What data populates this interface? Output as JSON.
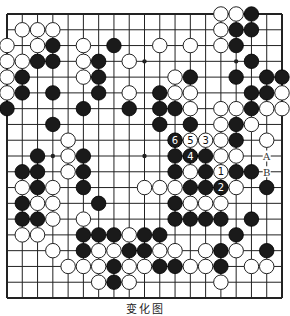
{
  "diagram": {
    "type": "go-board",
    "size": 19,
    "line_color": "#222222",
    "black_color": "#1a1a1a",
    "white_color": "#ffffff",
    "grid": {
      "left": 7,
      "top": 14,
      "right": 282,
      "bottom": 298
    },
    "star_points": [
      [
        3,
        3
      ],
      [
        3,
        9
      ],
      [
        3,
        15
      ],
      [
        9,
        3
      ],
      [
        9,
        9
      ],
      [
        9,
        15
      ],
      [
        15,
        3
      ],
      [
        15,
        9
      ],
      [
        15,
        15
      ]
    ],
    "stones": {
      "black": [
        [
          16,
          0
        ],
        [
          15,
          1
        ],
        [
          16,
          1
        ],
        [
          3,
          2
        ],
        [
          7,
          2
        ],
        [
          15,
          2
        ],
        [
          2,
          3
        ],
        [
          3,
          3
        ],
        [
          6,
          3
        ],
        [
          16,
          3
        ],
        [
          1,
          4
        ],
        [
          6,
          4
        ],
        [
          12,
          4
        ],
        [
          15,
          4
        ],
        [
          17,
          4
        ],
        [
          18,
          4
        ],
        [
          1,
          5
        ],
        [
          3,
          5
        ],
        [
          6,
          5
        ],
        [
          10,
          5
        ],
        [
          16,
          5
        ],
        [
          17,
          5
        ],
        [
          0,
          6
        ],
        [
          5,
          6
        ],
        [
          8,
          6
        ],
        [
          10,
          6
        ],
        [
          11,
          6
        ],
        [
          16,
          6
        ],
        [
          3,
          7
        ],
        [
          10,
          7
        ],
        [
          12,
          7
        ],
        [
          15,
          7
        ],
        [
          15,
          8
        ],
        [
          2,
          9
        ],
        [
          5,
          9
        ],
        [
          11,
          9
        ],
        [
          13,
          9
        ],
        [
          1,
          10
        ],
        [
          2,
          10
        ],
        [
          5,
          10
        ],
        [
          11,
          10
        ],
        [
          13,
          10
        ],
        [
          15,
          10
        ],
        [
          16,
          10
        ],
        [
          2,
          11
        ],
        [
          5,
          11
        ],
        [
          12,
          11
        ],
        [
          13,
          11
        ],
        [
          17,
          11
        ],
        [
          1,
          12
        ],
        [
          6,
          12
        ],
        [
          11,
          12
        ],
        [
          1,
          13
        ],
        [
          2,
          13
        ],
        [
          11,
          13
        ],
        [
          12,
          13
        ],
        [
          13,
          13
        ],
        [
          14,
          13
        ],
        [
          16,
          13
        ],
        [
          5,
          14
        ],
        [
          6,
          14
        ],
        [
          7,
          14
        ],
        [
          9,
          14
        ],
        [
          10,
          14
        ],
        [
          15,
          14
        ],
        [
          5,
          15
        ],
        [
          8,
          15
        ],
        [
          9,
          15
        ],
        [
          14,
          15
        ],
        [
          17,
          15
        ],
        [
          7,
          16
        ],
        [
          10,
          16
        ],
        [
          11,
          16
        ],
        [
          14,
          16
        ],
        [
          7,
          17
        ]
      ],
      "white": [
        [
          14,
          0
        ],
        [
          15,
          0
        ],
        [
          1,
          1
        ],
        [
          2,
          1
        ],
        [
          3,
          1
        ],
        [
          14,
          1
        ],
        [
          0,
          2
        ],
        [
          2,
          2
        ],
        [
          5,
          2
        ],
        [
          10,
          2
        ],
        [
          12,
          2
        ],
        [
          14,
          2
        ],
        [
          0,
          3
        ],
        [
          1,
          3
        ],
        [
          5,
          3
        ],
        [
          8,
          3
        ],
        [
          0,
          4
        ],
        [
          5,
          4
        ],
        [
          11,
          4
        ],
        [
          0,
          5
        ],
        [
          8,
          5
        ],
        [
          11,
          5
        ],
        [
          12,
          5
        ],
        [
          18,
          5
        ],
        [
          12,
          6
        ],
        [
          14,
          6
        ],
        [
          15,
          6
        ],
        [
          17,
          6
        ],
        [
          18,
          6
        ],
        [
          14,
          7
        ],
        [
          16,
          7
        ],
        [
          4,
          8
        ],
        [
          14,
          8
        ],
        [
          17,
          8
        ],
        [
          4,
          9
        ],
        [
          14,
          9
        ],
        [
          15,
          9
        ],
        [
          4,
          10
        ],
        [
          12,
          10
        ],
        [
          1,
          11
        ],
        [
          3,
          11
        ],
        [
          9,
          11
        ],
        [
          10,
          11
        ],
        [
          11,
          11
        ],
        [
          15,
          11
        ],
        [
          2,
          12
        ],
        [
          3,
          12
        ],
        [
          12,
          12
        ],
        [
          13,
          12
        ],
        [
          14,
          12
        ],
        [
          3,
          13
        ],
        [
          5,
          13
        ],
        [
          1,
          14
        ],
        [
          2,
          14
        ],
        [
          8,
          14
        ],
        [
          3,
          15
        ],
        [
          6,
          15
        ],
        [
          7,
          15
        ],
        [
          10,
          15
        ],
        [
          11,
          15
        ],
        [
          13,
          15
        ],
        [
          15,
          15
        ],
        [
          4,
          16
        ],
        [
          5,
          16
        ],
        [
          6,
          16
        ],
        [
          8,
          16
        ],
        [
          9,
          16
        ],
        [
          12,
          16
        ],
        [
          13,
          16
        ],
        [
          16,
          16
        ],
        [
          17,
          16
        ],
        [
          6,
          17
        ],
        [
          8,
          17
        ],
        [
          14,
          17
        ]
      ]
    },
    "numbered_moves": [
      {
        "label": "1",
        "color": "white",
        "col": 14,
        "row": 10
      },
      {
        "label": "2",
        "color": "black",
        "col": 14,
        "row": 11
      },
      {
        "label": "3",
        "color": "white",
        "col": 13,
        "row": 8
      },
      {
        "label": "4",
        "color": "black",
        "col": 12,
        "row": 9
      },
      {
        "label": "5",
        "color": "white",
        "col": 12,
        "row": 8
      },
      {
        "label": "6",
        "color": "black",
        "col": 11,
        "row": 8
      }
    ],
    "point_labels": [
      {
        "label": "A",
        "col": 17,
        "row": 9
      },
      {
        "label": "B",
        "col": 17,
        "row": 10
      }
    ],
    "caption": "变化图"
  }
}
